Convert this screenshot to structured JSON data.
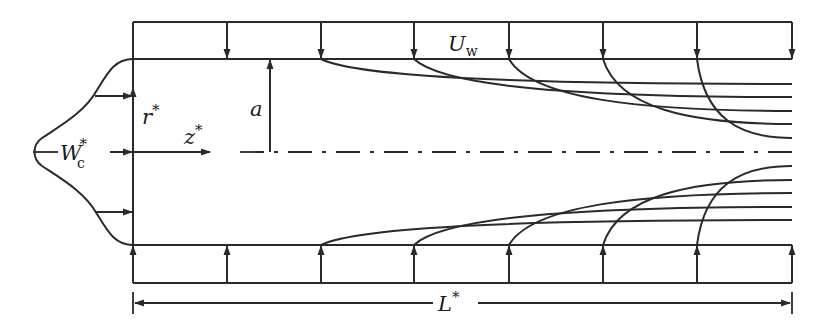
{
  "figure": {
    "type": "schematic",
    "colors": {
      "line": "#2a2a2a",
      "background": "#ffffff"
    },
    "labels": {
      "wall_velocity": {
        "main": "U",
        "sub": "w"
      },
      "radius": {
        "main": "a"
      },
      "radial_coord": {
        "main": "r",
        "sup": "*"
      },
      "axial_coord": {
        "main": "z",
        "sup": "*"
      },
      "inlet_velocity": {
        "main": "W",
        "sub": "c",
        "sup": "*"
      },
      "length": {
        "main": "L",
        "sup": "*"
      }
    },
    "geometry": {
      "x_left": 133,
      "x_right": 792,
      "outer_top_y": 22,
      "wall_top_y": 59,
      "centerline_y": 152,
      "wall_bottom_y": 245,
      "outer_bottom_y": 283,
      "dimension_line_y": 303,
      "wall_arrow_x": [
        227,
        321,
        414,
        509,
        603,
        697,
        792
      ],
      "streamline_start_x": [
        321,
        414,
        509,
        603,
        697
      ],
      "streamline_end_offsets_y": [
        14,
        28,
        41,
        55,
        68
      ],
      "inlet_arrow_y": [
        96,
        152,
        212
      ]
    }
  }
}
